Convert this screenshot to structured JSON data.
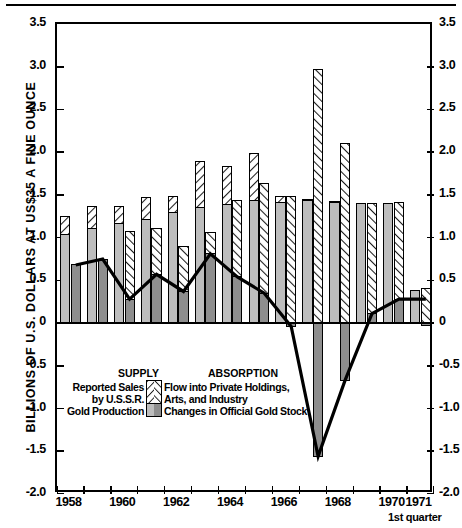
{
  "axis": {
    "y_title": "BILLIONS OF U.S. DOLLARS AT US$35 A FINE OUNCE",
    "y_ticks": [
      "3.5",
      "3.0",
      "2.5",
      "2.0",
      "1.5",
      "1.0",
      "0.5",
      "0",
      "-0.5",
      "-1.0",
      "-1.5",
      "-2.0"
    ],
    "y_tick_values": [
      3.5,
      3.0,
      2.5,
      2.0,
      1.5,
      1.0,
      0.5,
      0,
      -0.5,
      -1.0,
      -1.5,
      -2.0
    ],
    "x_ticks": [
      "1958",
      "1960",
      "1962",
      "1964",
      "1966",
      "1968",
      "1970",
      "1971"
    ],
    "x_tick_values": [
      1958,
      1960,
      1962,
      1964,
      1966,
      1968,
      1970,
      1971
    ],
    "quarter_note": "1st quarter"
  },
  "legend": {
    "supply_heading": "SUPPLY",
    "absorption_heading": "ABSORPTION",
    "supply_item_1": "Reported Sales",
    "supply_item_1b": "by U.S.S.R.",
    "supply_item_2": "Gold Production",
    "absorption_item_1": "Flow into Private Holdings,",
    "absorption_item_1b": "Arts, and Industry",
    "absorption_item_2": "Changes in Official Gold Stock"
  },
  "colors": {
    "gold_production": "#bdbdbd",
    "ussr_sales": "#ffffff",
    "private_flow": "#ffffff",
    "official_stock": "#8e8e8e",
    "line": "#000000",
    "frame": "#000000",
    "background": "#ffffff"
  },
  "chart_data": {
    "type": "bar",
    "title": "",
    "subtitle": "",
    "xlabel": "",
    "ylabel": "BILLIONS OF U.S. DOLLARS AT US$35 A FINE OUNCE",
    "ylim": [
      -2.0,
      3.5
    ],
    "xlim": [
      1957.5,
      1971.5
    ],
    "grid": false,
    "legend_position": "inside-lower-left",
    "categories": [
      "1958",
      "1959",
      "1960",
      "1961",
      "1962",
      "1963",
      "1964",
      "1965",
      "1966",
      "1967",
      "1968",
      "1969",
      "1970",
      "1971"
    ],
    "series": [
      {
        "name": "Gold Production",
        "group": "supply",
        "stack": "supply",
        "values": [
          1.04,
          1.11,
          1.17,
          1.21,
          1.29,
          1.35,
          1.39,
          1.44,
          1.41,
          1.43,
          1.41,
          1.4,
          1.4,
          0.38
        ]
      },
      {
        "name": "Reported Sales by U.S.S.R.",
        "group": "supply",
        "stack": "supply",
        "values": [
          0.21,
          0.26,
          0.19,
          0.26,
          0.19,
          0.54,
          0.44,
          0.54,
          0.07,
          0.02,
          0.01,
          0.0,
          0.0,
          0.0
        ]
      },
      {
        "name": "Flow into Private Holdings, Arts, and Industry",
        "group": "absorption",
        "stack": "absorption",
        "values": [
          0.57,
          0.62,
          1.07,
          1.11,
          0.9,
          1.06,
          1.44,
          1.63,
          1.48,
          2.97,
          2.1,
          1.4,
          1.41,
          0.4
        ]
      },
      {
        "name": "Changes in Official Gold Stock",
        "group": "absorption",
        "stack": "absorption",
        "values": [
          0.68,
          0.75,
          0.28,
          0.57,
          0.37,
          0.81,
          0.54,
          0.35,
          -0.04,
          -1.56,
          -0.67,
          0.11,
          0.28,
          -0.03
        ]
      }
    ],
    "line_overlay": {
      "name": "Changes in Official Gold Stock",
      "x": [
        "1958",
        "1959",
        "1960",
        "1961",
        "1962",
        "1963",
        "1964",
        "1965",
        "1966",
        "1967",
        "1968",
        "1969",
        "1970",
        "1971"
      ],
      "values": [
        0.68,
        0.75,
        0.28,
        0.57,
        0.37,
        0.81,
        0.54,
        0.35,
        -0.04,
        -1.56,
        -0.67,
        0.11,
        0.28,
        0.28
      ]
    },
    "bar_totals": {
      "supply": [
        1.25,
        1.37,
        1.36,
        1.47,
        1.48,
        1.89,
        1.83,
        1.98,
        1.48,
        1.45,
        1.42,
        1.4,
        1.4,
        0.38
      ],
      "absorption": [
        1.25,
        1.37,
        1.35,
        1.68,
        1.27,
        1.87,
        1.98,
        1.98,
        1.44,
        2.97,
        2.1,
        1.51,
        1.69,
        0.4
      ]
    }
  }
}
